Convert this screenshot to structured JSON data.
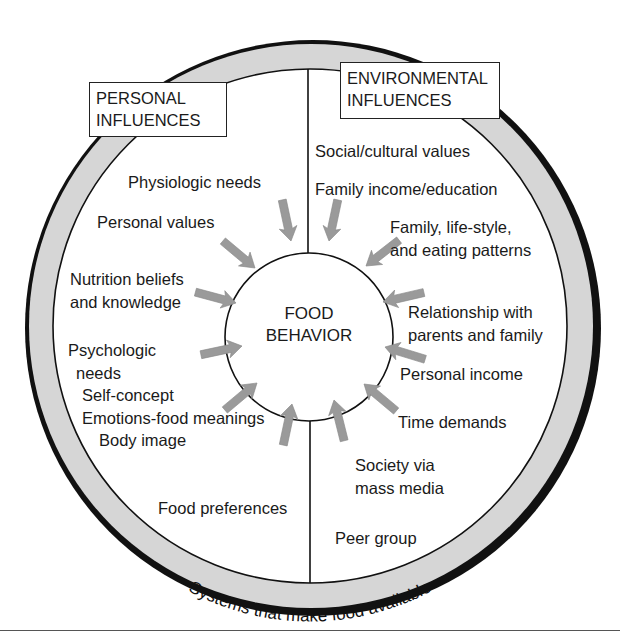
{
  "diagram": {
    "center": {
      "line1": "FOOD",
      "line2": "BEHAVIOR"
    },
    "ring_label": "Systems that make food available",
    "colors": {
      "ring_fill": "#d6d6d6",
      "stroke": "#111111",
      "arrow": "#9a9a9a"
    },
    "personal": {
      "title_line1": "PERSONAL",
      "title_line2": "INFLUENCES",
      "items": [
        "Physiologic needs",
        "Personal values",
        "Nutrition beliefs",
        "and knowledge",
        "Psychologic",
        "needs",
        "Self-concept",
        "Emotions-food meanings",
        "Body image",
        "Food preferences"
      ]
    },
    "environmental": {
      "title_line1": "ENVIRONMENTAL",
      "title_line2": "INFLUENCES",
      "items": [
        "Social/cultural values",
        "Family income/education",
        "Family, life-style,",
        "and eating patterns",
        "Relationship with",
        "parents and family",
        "Personal income",
        "Time demands",
        "Society via",
        "mass media",
        "Peer group"
      ]
    }
  }
}
